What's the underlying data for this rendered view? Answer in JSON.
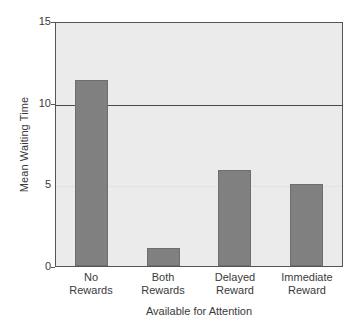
{
  "chart_data": {
    "type": "bar",
    "title": "",
    "xlabel": "Available for Attention",
    "ylabel": "Mean Waiting Time",
    "categories": [
      "No Rewards",
      "Both Rewards",
      "Delayed Reward",
      "Immediate Reward"
    ],
    "category_lines": [
      [
        "No",
        "Rewards"
      ],
      [
        "Both",
        "Rewards"
      ],
      [
        "Delayed",
        "Reward"
      ],
      [
        "Immediate",
        "Reward"
      ]
    ],
    "values": [
      11.4,
      1.1,
      5.9,
      5.0
    ],
    "ylim": [
      0,
      15
    ],
    "yticks": [
      0,
      5,
      10,
      15
    ],
    "ytick_labels": [
      "0",
      "5",
      "10",
      "15"
    ],
    "grid": "horizontal rule at y=10",
    "legend": "none",
    "colors": {
      "bar_fill": "#808080",
      "bar_edge": "#6e6e6e",
      "plot_background": "#ebebeb",
      "page_background": "#ffffff",
      "axis": "#555555",
      "text": "#3a3a3a",
      "gridline": "#4a4a4a"
    }
  }
}
